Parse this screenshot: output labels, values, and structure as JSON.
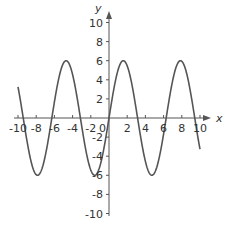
{
  "chart_data": {
    "type": "line",
    "title": "",
    "xlabel": "x",
    "ylabel": "y",
    "xlim": [
      -10,
      10
    ],
    "ylim": [
      -10,
      10
    ],
    "grid": false,
    "function": "y = 6 sin(x)",
    "x_ticks": [
      -10,
      -8,
      -6,
      -4,
      -2,
      2,
      4,
      6,
      8,
      10
    ],
    "y_ticks": [
      -10,
      -8,
      -6,
      -4,
      -2,
      2,
      4,
      6,
      8,
      10
    ],
    "origin_label": "0",
    "series": [
      {
        "name": "6 sin(x)",
        "color": "#555555",
        "x": [
          -10,
          -9,
          -8,
          -7,
          -6,
          -5,
          -4,
          -3,
          -2,
          -1,
          0,
          1,
          2,
          3,
          4,
          5,
          6,
          7,
          8,
          9,
          10
        ],
        "values": [
          3.26,
          -2.47,
          -5.94,
          -3.94,
          1.68,
          5.75,
          4.54,
          -0.85,
          -5.46,
          -5.05,
          0,
          5.05,
          5.46,
          0.85,
          -4.54,
          -5.75,
          -1.68,
          3.94,
          5.94,
          2.47,
          -3.26
        ]
      }
    ]
  },
  "colors": {
    "axis": "#555555",
    "curve": "#555555",
    "text": "#333333"
  }
}
